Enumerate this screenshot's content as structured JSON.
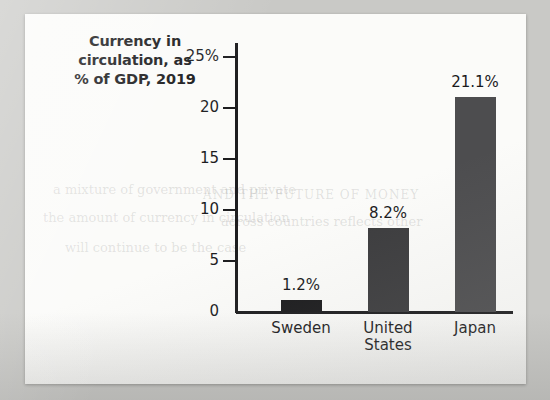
{
  "figure": {
    "title_lines": [
      "Currency in",
      "circulation, as",
      "% of GDP, 2019"
    ]
  },
  "chart_data": {
    "type": "bar",
    "title": "Currency in circulation, as % of GDP, 2019",
    "xlabel": "",
    "ylabel": "",
    "ylim": [
      0,
      25
    ],
    "grid": false,
    "legend": null,
    "categories": [
      "Sweden",
      "United States",
      "Japan"
    ],
    "category_lines": [
      [
        "Sweden"
      ],
      [
        "United",
        "States"
      ],
      [
        "Japan"
      ]
    ],
    "values": [
      1.2,
      8.2,
      21.1
    ],
    "value_labels": [
      "1.2%",
      "8.2%",
      "21.1%"
    ],
    "y_ticks": [
      0,
      5,
      10,
      15,
      20,
      25
    ],
    "y_tick_labels": [
      "0",
      "5",
      "10",
      "15",
      "20",
      "25%"
    ],
    "bar_colors": [
      "#1b1b1d",
      "#3c3c3e",
      "#4d4d4f"
    ]
  },
  "colors": {
    "page_background": "#c9c9c6",
    "card_background": "#fbfbf9",
    "axis": "#1d1d1f",
    "text": "#1a1a1c"
  },
  "bleed_through": [
    "a mixture of government and private",
    "the amount of currency in circulation",
    "AND THE FUTURE OF MONEY",
    "across countries reflects other",
    "will continue to be the case"
  ]
}
